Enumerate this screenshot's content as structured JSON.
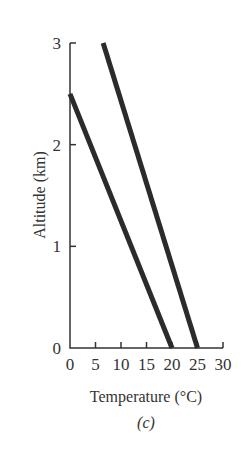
{
  "chart_data": {
    "type": "line",
    "title": "",
    "panel_label": "(c)",
    "xlabel": "Temperature (°C)",
    "ylabel": "Altitude (km)",
    "xlim": [
      0,
      30
    ],
    "ylim": [
      0,
      3
    ],
    "xticks": [
      0,
      5,
      10,
      15,
      20,
      25,
      30
    ],
    "yticks": [
      0,
      1,
      2,
      3
    ],
    "xtick_labels": [
      "0",
      "5",
      "10",
      "15",
      "20",
      "25",
      "30"
    ],
    "ytick_labels": [
      "0",
      "1",
      "2",
      "3"
    ],
    "grid": false,
    "legend": null,
    "series": [
      {
        "name": "profile-1",
        "x": [
          0,
          20
        ],
        "y": [
          2.5,
          0
        ],
        "color": "#2b2b2b"
      },
      {
        "name": "profile-2",
        "x": [
          6.5,
          25
        ],
        "y": [
          3,
          0
        ],
        "color": "#2b2b2b"
      }
    ]
  }
}
